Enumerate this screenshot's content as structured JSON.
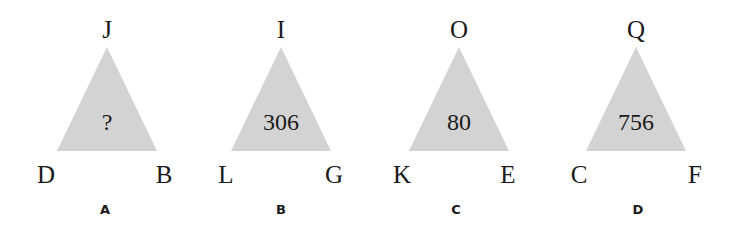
{
  "puzzle": {
    "panels": [
      {
        "label": "A",
        "top": "J",
        "left": "D",
        "right": "B",
        "center": "?"
      },
      {
        "label": "B",
        "top": "I",
        "left": "L",
        "right": "G",
        "center": "306"
      },
      {
        "label": "C",
        "top": "O",
        "left": "K",
        "right": "E",
        "center": "80"
      },
      {
        "label": "D",
        "top": "Q",
        "left": "C",
        "right": "F",
        "center": "756"
      }
    ],
    "colors": {
      "triangle_fill": "#d3d3d3",
      "text": "#1a1a1a",
      "background": "#ffffff"
    }
  }
}
